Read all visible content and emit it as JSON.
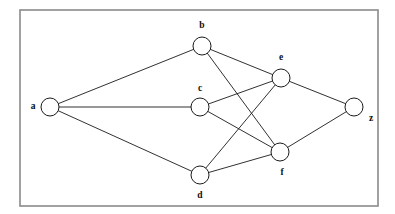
{
  "diagram": {
    "type": "node-link-graph",
    "background_color": "#ffffff",
    "frame": {
      "name": "border-frame",
      "x": 20,
      "y": 10,
      "width": 358,
      "height": 196,
      "stroke_color": "#8a8a8a"
    },
    "node_style": {
      "radius": 9,
      "fill_color": "#ffffff",
      "stroke_color": "#1a1a1a"
    },
    "edge_style": {
      "stroke_color": "#1a1a1a"
    },
    "nodes": [
      {
        "id": "a",
        "label": "a",
        "cx": 50,
        "cy": 107,
        "label_x": 33,
        "label_y": 107
      },
      {
        "id": "b",
        "label": "b",
        "cx": 202,
        "cy": 46,
        "label_x": 202,
        "label_y": 26
      },
      {
        "id": "c",
        "label": "c",
        "cx": 200,
        "cy": 107,
        "label_x": 200,
        "label_y": 89
      },
      {
        "id": "d",
        "label": "d",
        "cx": 200,
        "cy": 175,
        "label_x": 200,
        "label_y": 196
      },
      {
        "id": "e",
        "label": "e",
        "cx": 281,
        "cy": 78,
        "label_x": 281,
        "label_y": 58
      },
      {
        "id": "f",
        "label": "f",
        "cx": 280,
        "cy": 152,
        "label_x": 282,
        "label_y": 173
      },
      {
        "id": "z",
        "label": "z",
        "cx": 354,
        "cy": 107,
        "label_x": 371,
        "label_y": 119
      }
    ],
    "edges": [
      {
        "id": "a-b",
        "from": "a",
        "to": "b"
      },
      {
        "id": "a-c",
        "from": "a",
        "to": "c"
      },
      {
        "id": "a-d",
        "from": "a",
        "to": "d"
      },
      {
        "id": "b-e",
        "from": "b",
        "to": "e"
      },
      {
        "id": "b-f",
        "from": "b",
        "to": "f"
      },
      {
        "id": "c-e",
        "from": "c",
        "to": "e"
      },
      {
        "id": "c-f",
        "from": "c",
        "to": "f"
      },
      {
        "id": "d-e",
        "from": "d",
        "to": "e"
      },
      {
        "id": "d-f",
        "from": "d",
        "to": "f"
      },
      {
        "id": "e-z",
        "from": "e",
        "to": "z"
      },
      {
        "id": "f-z",
        "from": "f",
        "to": "z"
      }
    ]
  }
}
